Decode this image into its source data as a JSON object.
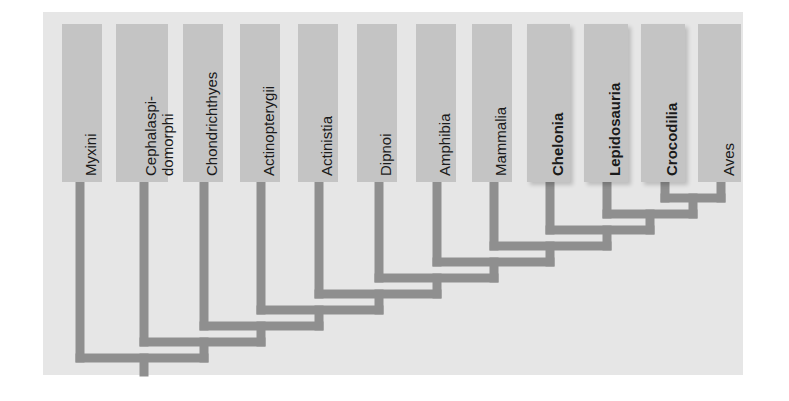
{
  "diagram": {
    "type": "cladogram",
    "taxa": [
      {
        "name": "Myxini",
        "bold": false
      },
      {
        "name": "Cephalaspi-\ndomorphi",
        "line1": "Cephalaspi-",
        "line2": "domorphi",
        "bold": false
      },
      {
        "name": "Chondrichthyes",
        "bold": false
      },
      {
        "name": "Actinopterygii",
        "bold": false
      },
      {
        "name": "Actinistia",
        "bold": false
      },
      {
        "name": "Dipnoi",
        "bold": false
      },
      {
        "name": "Amphibia",
        "bold": false
      },
      {
        "name": "Mammalia",
        "bold": false
      },
      {
        "name": "Chelonia",
        "bold": true
      },
      {
        "name": "Lepidosauria",
        "bold": true
      },
      {
        "name": "Crocodilia",
        "bold": true
      },
      {
        "name": "Aves",
        "bold": false
      }
    ],
    "topology": "(Myxini,(Cephalaspidomorphi,(Chondrichthyes,(Actinopterygii,(Actinistia,(Dipnoi,(Amphibia,(Mammalia,(Chelonia,(Lepidosauria,(Crocodilia,Aves)))))))))))",
    "colors": {
      "background": "#e6e6e6",
      "box": "#c4c4c4",
      "branch": "#8f8f8f",
      "text": "#1a1a1a"
    }
  }
}
